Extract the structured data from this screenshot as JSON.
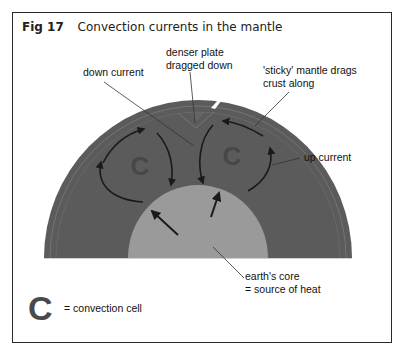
{
  "figure": {
    "number": "Fig 17",
    "title": "Convection currents in the mantle"
  },
  "labels": {
    "denser_plate": [
      "denser plate",
      "dragged down"
    ],
    "down_current": "down current",
    "sticky_mantle": [
      "'sticky' mantle drags",
      "crust along"
    ],
    "up_current": "up current",
    "earths_core": [
      "earth's core",
      "= source of heat"
    ]
  },
  "legend": {
    "symbol": "C",
    "text": "= convection cell"
  },
  "cells": [
    {
      "symbol": "C",
      "position": "left"
    },
    {
      "symbol": "C",
      "position": "right"
    }
  ],
  "colors": {
    "mantle": "#5b5b5b",
    "crust": "#676767",
    "core": "#9a9a9a",
    "arrow": "#1a1a1a",
    "cell_symbol": "#474747",
    "frame": "#2a2a2a"
  }
}
